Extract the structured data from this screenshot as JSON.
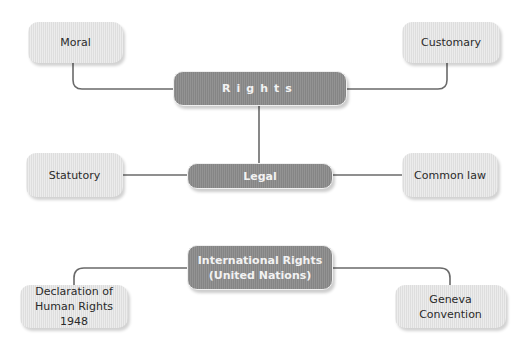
{
  "diagram": {
    "root": {
      "label": "Rights"
    },
    "branches": {
      "moral": {
        "label": "Moral"
      },
      "customary": {
        "label": "Customary"
      },
      "legal": {
        "label": "Legal"
      },
      "statutory": {
        "label": "Statutory"
      },
      "common_law": {
        "label": "Common law"
      }
    },
    "international": {
      "label_line1": "International Rights",
      "label_line2": "(United Nations)",
      "children": {
        "declaration": {
          "line1": "Declaration of",
          "line2": "Human Rights 1948"
        },
        "geneva": {
          "line1": "Geneva",
          "line2": "Convention"
        }
      }
    },
    "colors": {
      "light_box": "#e2e2e2",
      "dark_box": "#8a8a8a",
      "connector": "#6a6a6a"
    }
  }
}
